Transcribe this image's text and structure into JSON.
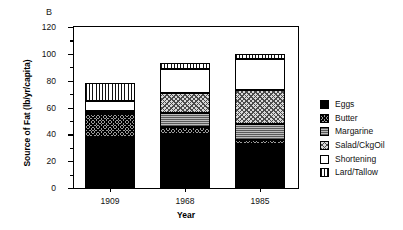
{
  "panel": {
    "label": "B"
  },
  "chart_data": {
    "type": "bar",
    "subtype": "stacked-bar",
    "title": "",
    "panel_label": "B",
    "xlabel": "Year",
    "ylabel": "Source of Fat (lb/yr/capita)",
    "categories": [
      "1909",
      "1968",
      "1985"
    ],
    "ylim": [
      0,
      120
    ],
    "yticks": [
      0,
      20,
      40,
      60,
      80,
      100,
      120
    ],
    "yticks_minor": [
      10,
      30,
      50,
      70,
      90,
      110
    ],
    "grid": false,
    "legend_position": "right",
    "series": [
      {
        "name": "Eggs",
        "fill": "solid-black",
        "color": "#000000",
        "values": [
          38,
          40,
          33
        ]
      },
      {
        "name": "Butter",
        "fill": "cross-hatch",
        "color": "#9a9a9a",
        "values": [
          17,
          5.5,
          3
        ]
      },
      {
        "name": "Margarine",
        "fill": "horizontal-lines",
        "color": "#8a8a8a",
        "values": [
          1,
          10.5,
          12
        ]
      },
      {
        "name": "Salad/CkgOil",
        "fill": "diagonal-hatch",
        "color": "#d8d8d8",
        "values": [
          1.5,
          15,
          25
        ]
      },
      {
        "name": "Shortening",
        "fill": "white",
        "color": "#ffffff",
        "values": [
          7.5,
          18,
          23
        ]
      },
      {
        "name": "Lard/Tallow",
        "fill": "vertical-lines",
        "color": "#ffffff",
        "values": [
          13,
          4,
          4
        ]
      }
    ],
    "totals": [
      78,
      93,
      100
    ]
  },
  "legend": {
    "items": [
      {
        "label": "Eggs"
      },
      {
        "label": "Butter"
      },
      {
        "label": "Margarine"
      },
      {
        "label": "Salad/CkgOil"
      },
      {
        "label": "Shortening"
      },
      {
        "label": "Lard/Tallow"
      }
    ]
  }
}
